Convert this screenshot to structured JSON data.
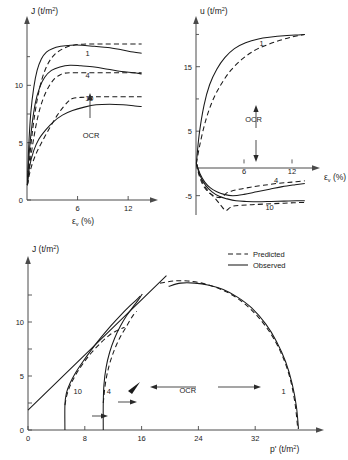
{
  "figure": {
    "title": "",
    "legend": {
      "predicted": "Predicted",
      "observed": "Observed"
    },
    "ocr_label": "OCR"
  },
  "chart_data": [
    {
      "id": "deviator-stress-vs-strain",
      "type": "line",
      "title": "",
      "xlabel": "εv (%)",
      "ylabel": "J (t/m2)",
      "xlim": [
        0,
        14
      ],
      "ylim": [
        0,
        15
      ],
      "xticks": [
        6,
        12
      ],
      "xticklabels": [
        "6",
        "12"
      ],
      "yticks": [
        0,
        5,
        10
      ],
      "yticklabels": [
        "0",
        "5",
        "10"
      ],
      "grid": false,
      "annotations": [
        {
          "text": "1",
          "x": 7.2,
          "y": 12.6
        },
        {
          "text": "4",
          "x": 7.2,
          "y": 10.6
        },
        {
          "text": "10",
          "x": 7.4,
          "y": 8.6
        },
        {
          "text": "OCR",
          "x": 7.6,
          "y": 5.4
        }
      ],
      "series": [
        {
          "name": "OCR 1 Observed",
          "style": "solid",
          "x": [
            0.05,
            0.2,
            0.45,
            0.8,
            1.2,
            1.7,
            2.3,
            3.0,
            4.0,
            5.2,
            6.5,
            8.0,
            9.6,
            11.2,
            12.6,
            13.6
          ],
          "y": [
            1.3,
            4.6,
            7.6,
            9.8,
            11.3,
            12.3,
            12.9,
            13.2,
            13.4,
            13.5,
            13.5,
            13.4,
            13.3,
            13.1,
            12.9,
            12.8
          ]
        },
        {
          "name": "OCR 1 Predicted",
          "style": "dashed",
          "x": [
            0.05,
            0.3,
            0.7,
            1.2,
            1.8,
            2.5,
            3.3,
            4.3,
            5.5,
            7.0,
            8.6,
            10.2,
            11.8,
            13.2,
            13.6
          ],
          "y": [
            1.3,
            3.6,
            6.3,
            8.7,
            10.6,
            11.9,
            12.7,
            13.2,
            13.5,
            13.6,
            13.6,
            13.6,
            13.6,
            13.6,
            13.6
          ]
        },
        {
          "name": "OCR 4 Observed",
          "style": "solid",
          "x": [
            0.05,
            0.25,
            0.6,
            1.0,
            1.5,
            2.1,
            2.9,
            3.9,
            5.1,
            6.4,
            8.0,
            9.6,
            11.2,
            12.6,
            13.6
          ],
          "y": [
            1.3,
            4.0,
            6.6,
            8.5,
            9.8,
            10.7,
            11.3,
            11.6,
            11.75,
            11.7,
            11.6,
            11.4,
            11.2,
            11.1,
            11.0
          ]
        },
        {
          "name": "OCR 4 Predicted",
          "style": "dashed",
          "x": [
            0.05,
            0.35,
            0.8,
            1.3,
            1.9,
            2.6,
            3.3,
            3.9,
            4.4,
            5.2,
            7.0,
            9.0,
            11.0,
            13.0,
            13.6
          ],
          "y": [
            1.3,
            3.2,
            5.4,
            7.3,
            8.8,
            9.9,
            10.6,
            10.9,
            11.05,
            11.1,
            11.1,
            11.1,
            11.1,
            11.1,
            11.1
          ]
        },
        {
          "name": "OCR 10 Observed",
          "style": "solid",
          "x": [
            0.05,
            0.3,
            0.8,
            1.4,
            2.2,
            3.1,
            4.2,
            5.4,
            6.8,
            8.2,
            9.8,
            11.4,
            12.8,
            13.6
          ],
          "y": [
            1.3,
            2.9,
            4.3,
            5.3,
            6.1,
            6.8,
            7.4,
            7.8,
            8.1,
            8.3,
            8.35,
            8.3,
            8.2,
            8.15
          ]
        },
        {
          "name": "OCR 10 Predicted",
          "style": "dashed",
          "x": [
            0.05,
            0.4,
            1.0,
            1.8,
            2.7,
            3.6,
            4.3,
            4.9,
            5.4,
            6.4,
            8.2,
            10.2,
            12.2,
            13.6
          ],
          "y": [
            1.3,
            2.6,
            3.9,
            5.1,
            6.3,
            7.4,
            8.1,
            8.6,
            8.85,
            8.95,
            9.0,
            9.0,
            9.0,
            9.0
          ]
        }
      ]
    },
    {
      "id": "pore-pressure-vs-strain",
      "type": "line",
      "title": "",
      "xlabel": "εv (%)",
      "ylabel": "u (t/m2)",
      "xlim": [
        0,
        14
      ],
      "ylim": [
        -8,
        21
      ],
      "xticks": [
        6,
        12
      ],
      "xticklabels": [
        "6",
        "12"
      ],
      "yticks": [
        -5,
        5,
        15
      ],
      "yticklabels": [
        "-5",
        "5",
        "15"
      ],
      "grid": false,
      "annotations": [
        {
          "text": "1",
          "x": 8.2,
          "y": 18.2
        },
        {
          "text": "OCR",
          "x": 7.2,
          "y": 6.5
        },
        {
          "text": "4",
          "x": 10.0,
          "y": -3.0
        },
        {
          "text": "10",
          "x": 9.2,
          "y": -7.2
        }
      ],
      "series": [
        {
          "name": "OCR 1 Observed",
          "style": "solid",
          "x": [
            0.05,
            0.4,
            1.0,
            1.7,
            2.6,
            3.6,
            4.8,
            6.2,
            7.8,
            9.4,
            11.0,
            12.4,
            13.6
          ],
          "y": [
            0,
            4.5,
            9.0,
            12.2,
            14.6,
            16.4,
            17.8,
            18.7,
            19.3,
            19.6,
            19.8,
            19.9,
            20.0
          ]
        },
        {
          "name": "OCR 1 Predicted",
          "style": "dashed",
          "x": [
            0.05,
            0.5,
            1.2,
            2.1,
            3.2,
            4.4,
            5.8,
            7.3,
            8.9,
            10.5,
            12.0,
            13.2,
            13.6
          ],
          "y": [
            0,
            3.0,
            6.6,
            9.8,
            12.4,
            14.5,
            16.2,
            17.5,
            18.4,
            19.1,
            19.6,
            19.9,
            20.0
          ]
        },
        {
          "name": "OCR 4 Observed",
          "style": "solid",
          "x": [
            0.05,
            0.5,
            1.1,
            1.8,
            2.6,
            3.5,
            4.6,
            6.0,
            7.6,
            9.2,
            10.8,
            12.4,
            13.6
          ],
          "y": [
            0,
            -1.6,
            -2.9,
            -3.8,
            -4.4,
            -4.8,
            -5.0,
            -4.8,
            -4.4,
            -4.0,
            -3.6,
            -3.3,
            -3.1
          ]
        },
        {
          "name": "OCR 4 Predicted",
          "style": "dashed",
          "x": [
            0.05,
            0.4,
            0.9,
            1.5,
            2.2,
            2.9,
            3.4,
            3.8,
            4.4,
            5.4,
            6.8,
            8.4,
            10.2,
            12.0,
            13.6
          ],
          "y": [
            0,
            -1.9,
            -3.4,
            -4.4,
            -5.0,
            -5.3,
            -5.1,
            -4.6,
            -4.3,
            -4.0,
            -3.7,
            -3.4,
            -3.1,
            -2.9,
            -2.7
          ]
        },
        {
          "name": "OCR 10 Observed",
          "style": "solid",
          "x": [
            0.05,
            0.5,
            1.2,
            2.0,
            2.9,
            3.9,
            5.0,
            6.3,
            7.8,
            9.4,
            11.0,
            12.6,
            13.6
          ],
          "y": [
            0,
            -1.9,
            -3.4,
            -4.4,
            -5.1,
            -5.5,
            -5.8,
            -5.9,
            -5.95,
            -5.9,
            -5.85,
            -5.8,
            -5.8
          ]
        },
        {
          "name": "OCR 10 Predicted",
          "style": "dashed",
          "x": [
            0.05,
            0.6,
            1.4,
            2.3,
            3.1,
            3.7,
            4.2,
            4.7,
            5.6,
            7.0,
            8.6,
            10.4,
            12.2,
            13.6
          ],
          "y": [
            0,
            -2.3,
            -4.1,
            -5.3,
            -6.5,
            -7.3,
            -6.9,
            -6.6,
            -6.5,
            -6.4,
            -6.3,
            -6.2,
            -6.1,
            -6.05
          ]
        }
      ]
    },
    {
      "id": "stress-path-j-vs-p",
      "type": "line",
      "title": "",
      "xlabel": "p' (t/m2)",
      "ylabel": "J (t/m2)",
      "xlim": [
        0,
        40
      ],
      "ylim": [
        0,
        15
      ],
      "xticks": [
        0,
        8,
        16,
        24,
        32
      ],
      "xticklabels": [
        "0",
        "8",
        "16",
        "24",
        "32"
      ],
      "yticks": [
        0,
        5,
        10
      ],
      "yticklabels": [
        "0",
        "5",
        "10"
      ],
      "grid": false,
      "annotations": [
        {
          "text": "10",
          "x": 7.0,
          "y": 3.3
        },
        {
          "text": "4",
          "x": 11.4,
          "y": 3.3
        },
        {
          "text": "1",
          "x": 36.0,
          "y": 3.3
        },
        {
          "text": "OCR",
          "x": 22.5,
          "y": 3.4
        }
      ],
      "series": [
        {
          "name": "Critical state line",
          "style": "solid",
          "x": [
            0,
            19.5
          ],
          "y": [
            1.85,
            14.3
          ]
        },
        {
          "name": "OCR 1 Observed",
          "style": "solid",
          "x": [
            19.8,
            21.5,
            23.5,
            25.5,
            27.5,
            29.5,
            31.5,
            33.5,
            35.0,
            36.3,
            37.2,
            37.8,
            38.1
          ],
          "y": [
            13.3,
            13.6,
            13.6,
            13.4,
            13.0,
            12.3,
            11.3,
            9.8,
            8.2,
            6.3,
            4.3,
            2.2,
            0.1
          ]
        },
        {
          "name": "OCR 1 Predicted",
          "style": "dashed",
          "x": [
            18.6,
            20.5,
            22.5,
            24.5,
            26.5,
            28.5,
            30.5,
            32.5,
            34.3,
            35.8,
            36.9,
            37.6,
            38.0
          ],
          "y": [
            13.6,
            13.8,
            13.8,
            13.6,
            13.2,
            12.6,
            11.7,
            10.4,
            8.8,
            6.9,
            4.8,
            2.5,
            0.1
          ]
        },
        {
          "name": "OCR 4 Observed",
          "style": "solid",
          "x": [
            10.6,
            10.6,
            10.7,
            11.0,
            11.5,
            12.2,
            13.0,
            13.9,
            14.8,
            15.5,
            15.9,
            16.1
          ],
          "y": [
            0.0,
            2.5,
            4.2,
            5.8,
            7.2,
            8.5,
            9.6,
            10.6,
            11.4,
            12.0,
            12.4,
            12.6
          ]
        },
        {
          "name": "OCR 4 Predicted",
          "style": "dashed",
          "x": [
            10.6,
            10.9,
            11.4,
            12.1,
            12.9,
            13.7,
            14.4,
            14.9,
            15.2,
            15.3
          ],
          "y": [
            2.5,
            4.3,
            5.9,
            7.3,
            8.5,
            9.4,
            10.2,
            10.7,
            10.9,
            11.0
          ]
        },
        {
          "name": "OCR 10 Observed",
          "style": "solid",
          "x": [
            5.2,
            5.2,
            5.4,
            5.9,
            6.7,
            7.7,
            8.9,
            10.2,
            11.6,
            13.0,
            14.2,
            15.2,
            15.8
          ],
          "y": [
            0.0,
            2.3,
            3.4,
            4.3,
            5.3,
            6.3,
            7.4,
            8.5,
            9.6,
            10.6,
            11.4,
            12.0,
            12.4
          ]
        },
        {
          "name": "OCR 10 Predicted",
          "style": "dashed",
          "x": [
            5.2,
            5.5,
            6.0,
            6.8,
            7.8,
            9.0,
            10.3,
            11.5,
            12.5,
            13.2,
            13.6
          ],
          "y": [
            2.3,
            3.3,
            4.2,
            5.2,
            6.2,
            7.2,
            8.1,
            8.8,
            9.2,
            9.4,
            9.5
          ]
        }
      ]
    }
  ]
}
